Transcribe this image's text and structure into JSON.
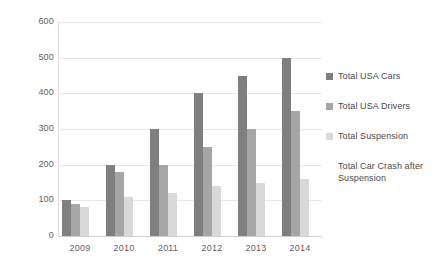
{
  "chart_data": {
    "type": "bar",
    "title": "",
    "subtitle": "",
    "xlabel": "",
    "ylabel": "",
    "categories": [
      "2009",
      "2010",
      "2011",
      "2012",
      "2013",
      "2014"
    ],
    "series": [
      {
        "name": "Total USA Cars",
        "color": "#7f7f7f",
        "values": [
          100,
          200,
          300,
          400,
          450,
          500
        ]
      },
      {
        "name": "Total USA Drivers",
        "color": "#a6a6a6",
        "values": [
          90,
          180,
          200,
          250,
          300,
          350
        ]
      },
      {
        "name": "Total Suspension",
        "color": "#d9d9d9",
        "values": [
          80,
          110,
          120,
          140,
          150,
          160
        ]
      },
      {
        "name": "Total Car Crash after Suspension",
        "color": "#f2f2f2",
        "values": [
          0,
          0,
          0,
          0,
          0,
          0
        ]
      }
    ],
    "ylim": [
      0,
      600
    ],
    "ytick_values": [
      0,
      100,
      200,
      300,
      400,
      500,
      600
    ],
    "ytick_labels": [
      "0",
      "100",
      "200",
      "300",
      "400",
      "500",
      "600"
    ],
    "grid": true,
    "grid_axis": "y",
    "legend_position": "right",
    "background_color": "#ffffff",
    "gridline_color": "#e8e8e8",
    "axis_color": "#d9d9d9",
    "text_color": "#595959"
  }
}
